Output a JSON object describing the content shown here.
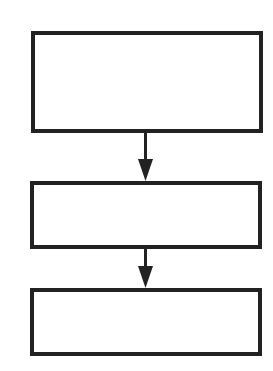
{
  "diagram": {
    "type": "flowchart",
    "orientation": "vertical",
    "stroke_color": "#222222",
    "background": "#ffffff",
    "nodes": [
      {
        "id": "box-1",
        "label": "",
        "x": 31,
        "y": 31,
        "w": 232,
        "h": 102
      },
      {
        "id": "box-2",
        "label": "",
        "x": 30,
        "y": 181,
        "w": 232,
        "h": 68
      },
      {
        "id": "box-3",
        "label": "",
        "x": 30,
        "y": 288,
        "w": 232,
        "h": 68
      }
    ],
    "edges": [
      {
        "from": "box-1",
        "to": "box-2"
      },
      {
        "from": "box-2",
        "to": "box-3"
      }
    ]
  }
}
